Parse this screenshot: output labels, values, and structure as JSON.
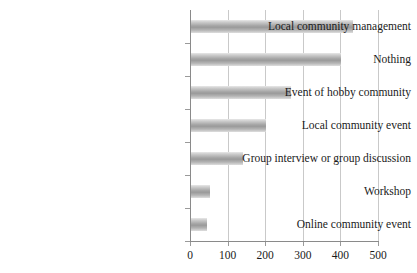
{
  "chart_data": {
    "type": "bar",
    "orientation": "horizontal",
    "title": "",
    "xlabel": "",
    "ylabel": "",
    "xlim": [
      0,
      500
    ],
    "xticks": [
      0,
      100,
      200,
      300,
      400,
      500
    ],
    "xtick_labels": [
      "0",
      "100",
      "200",
      "300",
      "400",
      "500"
    ],
    "grid": "vertical",
    "legend": "none",
    "bar_color": "#a8a8a8",
    "categories": [
      "Local community management",
      "Nothing",
      "Event of hobby community",
      "Local community event",
      "Group interview or group discussion",
      "Workshop",
      "Online community event"
    ],
    "values": [
      430,
      400,
      265,
      200,
      138,
      50,
      42
    ]
  }
}
